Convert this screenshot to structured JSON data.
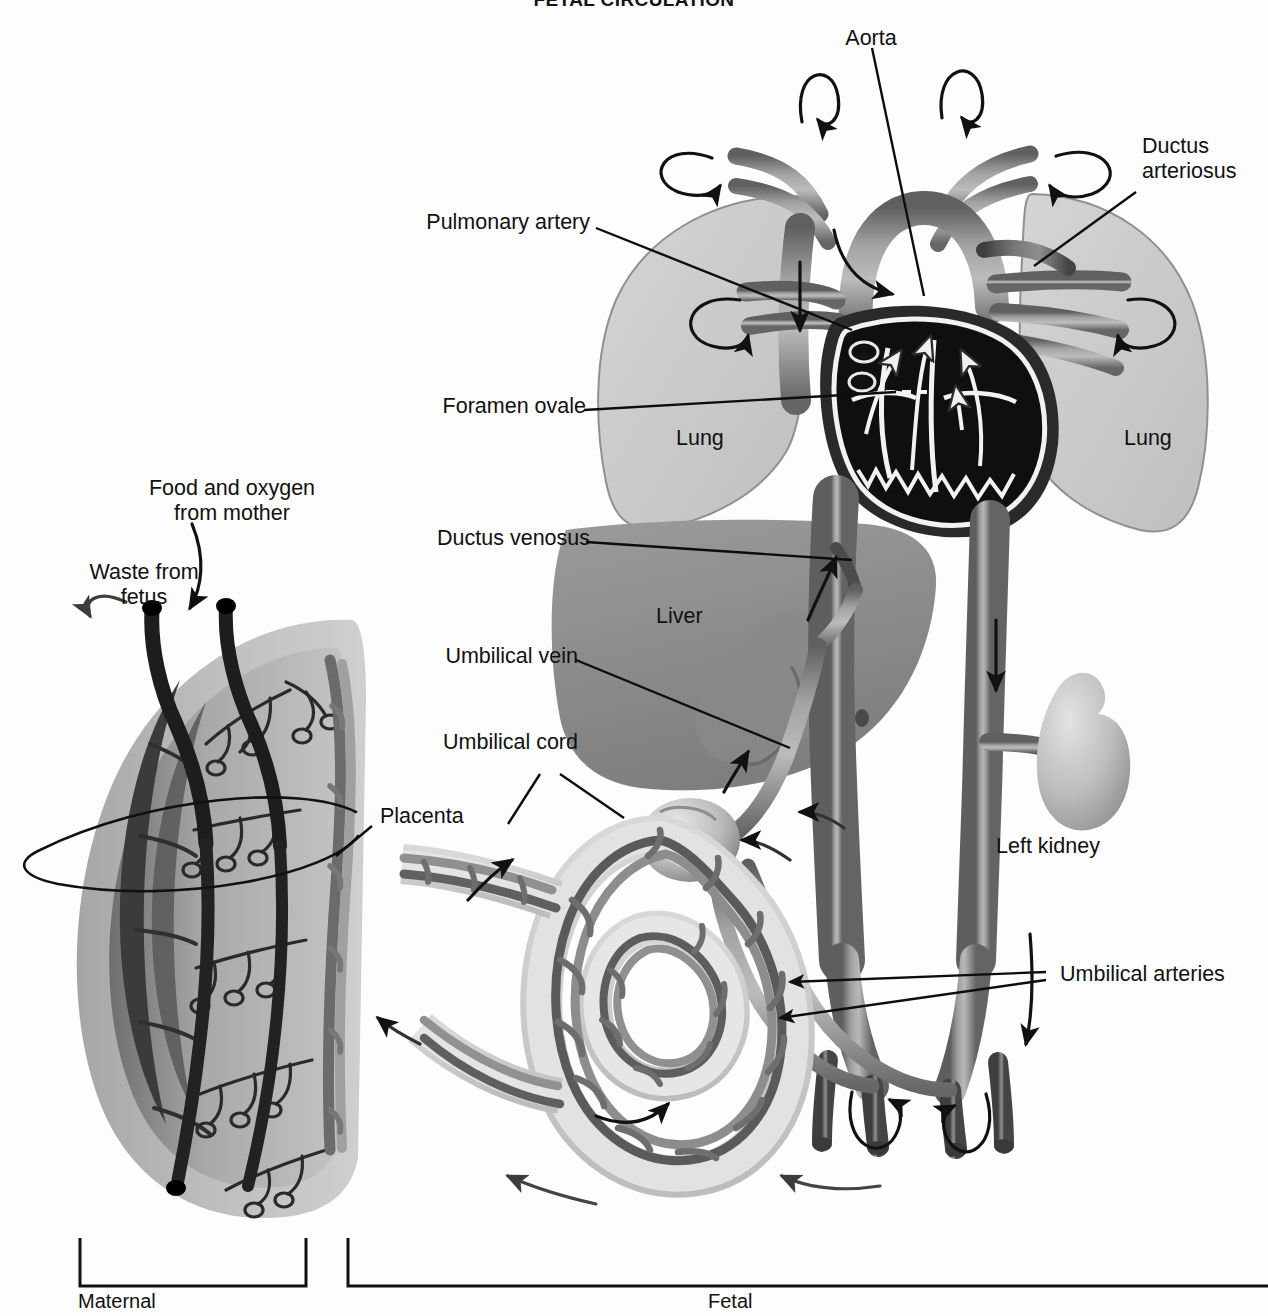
{
  "figure": {
    "title": "FETAL CIRCULATION",
    "type": "anatomical-diagram"
  },
  "labels": {
    "aorta": "Aorta",
    "ductus_arteriosus": "Ductus\narteriosus",
    "pulmonary_artery": "Pulmonary artery",
    "foramen_ovale": "Foramen ovale",
    "ductus_venosus": "Ductus venosus",
    "umbilical_vein": "Umbilical vein",
    "umbilical_cord": "Umbilical cord",
    "umbilical_arteries": "Umbilical arteries",
    "lung_left": "Lung",
    "lung_right": "Lung",
    "liver": "Liver",
    "left_kidney": "Left kidney",
    "placenta": "Placenta",
    "food_and_oxygen": "Food and oxygen\nfrom mother",
    "waste_from_fetus": "Waste from\nfetus"
  },
  "brackets": {
    "maternal": "Maternal",
    "fetal": "Fetal"
  },
  "colors": {
    "background": "#fdfdfd",
    "text": "#111111",
    "leader_line": "#0d0d0d",
    "lung_fill": "#c9c9c9",
    "lung_stroke": "#8f8f8f",
    "liver_fill": "#8e8e8e",
    "liver_dark": "#7a7a7a",
    "vessel_mid": "#8a8a8a",
    "vessel_dark": "#5c5c5c",
    "vessel_light": "#b4b4b4",
    "heart_chamber": "#111111",
    "heart_outline": "#f2f2f2",
    "kidney_fill": "#b9b9b9",
    "placenta_body": "#b0b0b0",
    "placenta_inner": "#9a9a9a",
    "placenta_dark": "#4e4e4e",
    "cord_sheath": "#cfcfcf",
    "arrow": "#111111"
  }
}
